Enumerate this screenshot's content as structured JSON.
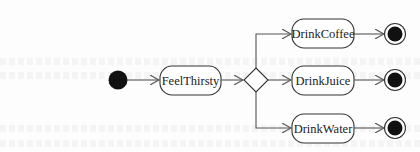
{
  "diagram": {
    "type": "uml-activity",
    "colors": {
      "line": "#555555",
      "fill_dark": "#111111",
      "node_fill": "#ffffff",
      "text": "#1a1a1a"
    },
    "initial_node": {
      "label": ""
    },
    "decision_node": {
      "label": ""
    },
    "states": [
      {
        "id": "feel",
        "label": "FeelThirsty"
      },
      {
        "id": "coffee",
        "label": "DrinkCoffee"
      },
      {
        "id": "juice",
        "label": "DrinkJuice"
      },
      {
        "id": "water",
        "label": "DrinkWater"
      }
    ],
    "final_nodes": 3,
    "edges": [
      [
        "initial",
        "FeelThirsty"
      ],
      [
        "FeelThirsty",
        "decision"
      ],
      [
        "decision",
        "DrinkCoffee"
      ],
      [
        "decision",
        "DrinkJuice"
      ],
      [
        "decision",
        "DrinkWater"
      ],
      [
        "DrinkCoffee",
        "final-1"
      ],
      [
        "DrinkJuice",
        "final-2"
      ],
      [
        "DrinkWater",
        "final-3"
      ]
    ]
  }
}
